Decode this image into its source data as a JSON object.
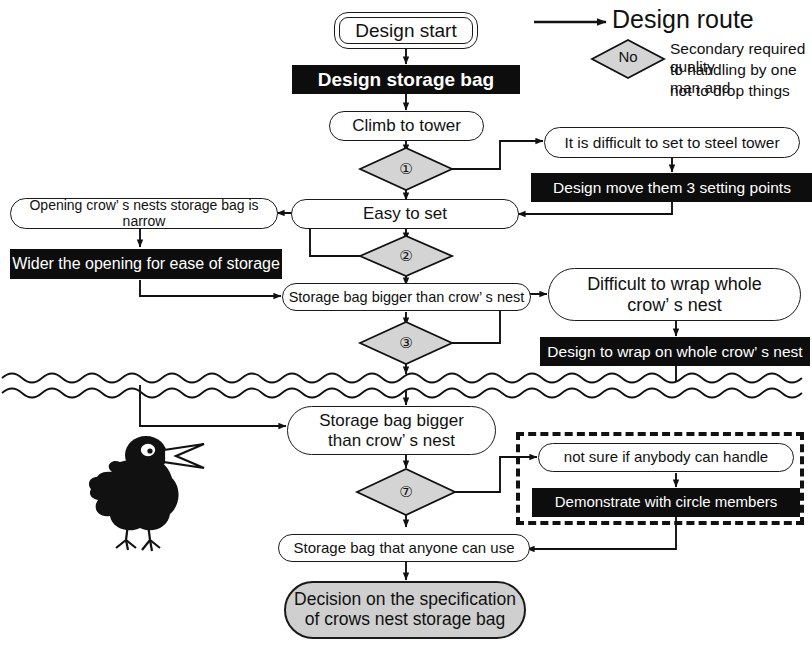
{
  "diagram": {
    "colors": {
      "ink": "#111111",
      "black_bar": "#0d0d0d",
      "bar_text": "#ffffff",
      "diamond_fill": "#d4d4d4",
      "terminal_fill": "#cfcfcf",
      "page": "#ffffff"
    }
  },
  "legend": {
    "route": {
      "label": "Design route",
      "icon": "arrow-right-icon"
    },
    "decision": {
      "diamond_label": "No",
      "description_lines": [
        "Secondary required quality",
        "to handling by one man and",
        "not to drop things"
      ]
    }
  },
  "nodes": {
    "design_start": {
      "label": "Design start",
      "type": "terminator-double"
    },
    "design_storage_bag": {
      "label": "Design storage bag",
      "type": "action-bar"
    },
    "climb_to_tower": {
      "label": "Climb to tower",
      "type": "process"
    },
    "difficult_steel": {
      "label": "It is difficult to set to steel tower",
      "type": "process"
    },
    "design_move_3": {
      "label": "Design move them 3 setting points",
      "type": "action-bar"
    },
    "easy_to_set": {
      "label": "Easy to set",
      "type": "process"
    },
    "opening_narrow": {
      "label": "Opening crow’ s nests storage bag is narrow",
      "type": "process"
    },
    "wider_opening": {
      "label": "Wider the opening for ease of storage",
      "type": "action-bar"
    },
    "bag_bigger_1": {
      "label": "Storage bag bigger than crow’ s nest",
      "type": "process"
    },
    "difficult_wrap": {
      "label": "Difficult to wrap whole\ncrow’ s nest",
      "type": "process"
    },
    "design_wrap": {
      "label": "Design to wrap on whole crow’ s nest",
      "type": "action-bar"
    },
    "bag_bigger_2": {
      "label": "Storage bag bigger\nthan crow’ s nest",
      "type": "process"
    },
    "not_sure_handle": {
      "label": "not sure if anybody can handle",
      "type": "process"
    },
    "demonstrate_circle": {
      "label": "Demonstrate with circle members",
      "type": "action-bar"
    },
    "bag_anyone_use": {
      "label": "Storage bag that anyone can use",
      "type": "process"
    },
    "final_decision": {
      "label": "Decision on the specification\nof crows nest storage bag",
      "type": "terminal"
    }
  },
  "decisions": {
    "d1": {
      "number": "①"
    },
    "d2": {
      "number": "②"
    },
    "d3": {
      "number": "③"
    },
    "d7": {
      "number": "⑦"
    }
  },
  "illustration": {
    "crow": "crow-bird-illustration"
  },
  "divider": {
    "style": "double-wavy-line",
    "name": "section-break"
  }
}
